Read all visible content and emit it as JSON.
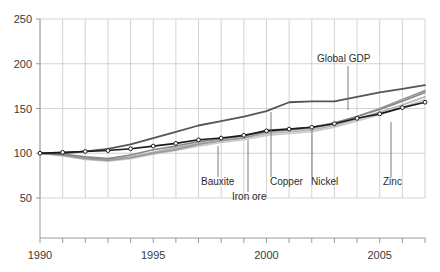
{
  "chart_data": {
    "type": "line",
    "title": "",
    "subtitle": "",
    "xlabel": "",
    "ylabel": "",
    "xlim": [
      1990,
      2007
    ],
    "ylim": [
      50,
      250
    ],
    "grid": true,
    "legend_position": "inline-annotations",
    "index_base": "1990 = 100",
    "x": [
      1990,
      1991,
      1992,
      1993,
      1994,
      1995,
      1996,
      1997,
      1998,
      1999,
      2000,
      2001,
      2002,
      2003,
      2004,
      2005,
      2006,
      2007
    ],
    "yticks": [
      50,
      100,
      150,
      200,
      250
    ],
    "ytick_labels": [
      "50",
      "100",
      "150",
      "200",
      "250"
    ],
    "xticks": [
      1990,
      1995,
      2000,
      2005
    ],
    "xtick_labels": [
      "1990",
      "1995",
      "2000",
      "2005"
    ],
    "series": [
      {
        "name": "Global GDP",
        "color": "#1a1a1a",
        "width": 1.6,
        "markers": true,
        "values": [
          100,
          101,
          102,
          103,
          105,
          108,
          111,
          115,
          117,
          120,
          125,
          127,
          129,
          133,
          139,
          144,
          151,
          157
        ]
      },
      {
        "name": "Bauxite",
        "color": "#555555",
        "width": 1.8,
        "markers": false,
        "values": [
          100,
          100,
          102,
          105,
          110,
          117,
          124,
          131,
          136,
          141,
          147,
          157,
          158,
          158,
          163,
          168,
          172,
          176
        ]
      },
      {
        "name": "Iron ore",
        "color": "#9a9a9a",
        "width": 1.7,
        "markers": false,
        "values": [
          100,
          98,
          94,
          92,
          95,
          100,
          104,
          110,
          114,
          117,
          124,
          126,
          128,
          133,
          141,
          150,
          160,
          170
        ]
      },
      {
        "name": "Copper",
        "color": "#878787",
        "width": 1.6,
        "markers": false,
        "values": [
          100,
          99,
          96,
          94,
          98,
          104,
          108,
          113,
          116,
          119,
          126,
          127,
          129,
          134,
          141,
          149,
          158,
          168
        ]
      },
      {
        "name": "Nickel",
        "color": "#b2b2b2",
        "width": 1.6,
        "markers": false,
        "values": [
          100,
          98,
          95,
          93,
          96,
          101,
          106,
          111,
          114,
          117,
          122,
          124,
          126,
          131,
          138,
          146,
          154,
          163
        ]
      },
      {
        "name": "Zinc",
        "color": "#c9c9c9",
        "width": 1.6,
        "markers": false,
        "values": [
          100,
          97,
          93,
          91,
          94,
          99,
          103,
          108,
          112,
          115,
          120,
          122,
          124,
          129,
          136,
          143,
          151,
          160
        ]
      }
    ],
    "annotations": [
      {
        "text": "Global GDP",
        "label_x": 317,
        "label_y": 62,
        "leader_x": 348,
        "leader_y1": 66,
        "leader_y2": 110
      },
      {
        "text": "Bauxite",
        "label_x": 201,
        "label_y": 185,
        "leader_x": 218,
        "leader_y1": 146,
        "leader_y2": 177
      },
      {
        "text": "Iron ore",
        "label_x": 232,
        "label_y": 200,
        "leader_x": 248,
        "leader_y1": 140,
        "leader_y2": 192
      },
      {
        "text": "Copper",
        "label_x": 270,
        "label_y": 185,
        "leader_x": 271,
        "leader_y1": 112,
        "leader_y2": 177
      },
      {
        "text": "Nickel",
        "label_x": 311,
        "label_y": 185,
        "leader_x": 312,
        "leader_y1": 128,
        "leader_y2": 177
      },
      {
        "text": "Zinc",
        "label_x": 383,
        "label_y": 185,
        "leader_x": 391,
        "leader_y1": 122,
        "leader_y2": 177
      }
    ]
  },
  "style": {
    "axis_color": "#9a9a9a",
    "grid_color": "#c8c8c8",
    "tick_text_color": "#3a3a3a",
    "annotation_text_color": "#2b2b2b",
    "leader_color": "#6e6e6e",
    "background": "#ffffff"
  }
}
